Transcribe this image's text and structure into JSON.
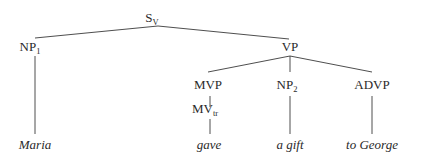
{
  "tree": {
    "nodes": {
      "s": {
        "label": "S",
        "sub": "V"
      },
      "np1": {
        "label": "NP",
        "sub": "1"
      },
      "vp": {
        "label": "VP",
        "sub": ""
      },
      "mvp": {
        "label": "MVP",
        "sub": ""
      },
      "mv": {
        "label": "MV",
        "sub": "tr"
      },
      "np2": {
        "label": "NP",
        "sub": "2"
      },
      "advp": {
        "label": "ADVP",
        "sub": ""
      }
    },
    "leaves": {
      "maria": "Maria",
      "gave": "gave",
      "gift": "a gift",
      "george": "to George"
    },
    "edges": [
      [
        "s",
        "np1"
      ],
      [
        "s",
        "vp"
      ],
      [
        "np1",
        "maria"
      ],
      [
        "vp",
        "mvp"
      ],
      [
        "vp",
        "np2"
      ],
      [
        "vp",
        "advp"
      ],
      [
        "mvp",
        "mv"
      ],
      [
        "mv",
        "gave"
      ],
      [
        "np2",
        "gift"
      ],
      [
        "advp",
        "george"
      ]
    ]
  }
}
